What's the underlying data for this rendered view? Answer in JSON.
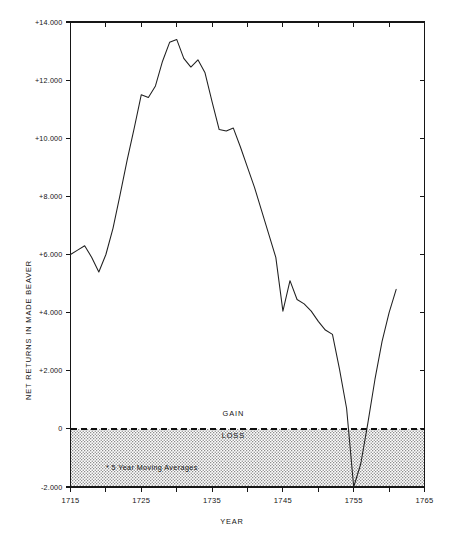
{
  "chart_data": {
    "type": "line",
    "title": "",
    "xlabel": "YEAR",
    "ylabel": "NET RETURNS IN MADE BEAVER",
    "xlim": [
      1715,
      1765
    ],
    "ylim": [
      -2000,
      14000
    ],
    "grid": false,
    "legend_position": "none",
    "x_tick_labels": [
      "1715",
      "1725",
      "1735",
      "1745",
      "1755",
      "1765"
    ],
    "x_tick_values": [
      1715,
      1725,
      1735,
      1745,
      1755,
      1765
    ],
    "x_minor_tick_values": [
      1720,
      1730,
      1740,
      1750,
      1760
    ],
    "y_tick_labels": [
      "+14.000",
      "+12.000",
      "+10.000",
      "+8.000",
      "+6.000",
      "+4.000",
      "+2.000",
      "0",
      "-2.000"
    ],
    "y_tick_values": [
      14000,
      12000,
      10000,
      8000,
      6000,
      4000,
      2000,
      0,
      -2000
    ],
    "annotations": [
      {
        "name": "gain-label",
        "text": "GAIN",
        "x": 1738,
        "y": 450
      },
      {
        "name": "loss-label",
        "text": "LOSS",
        "x": 1738,
        "y": -330
      },
      {
        "name": "moving-average-note",
        "text": "* 5 Year Moving Averages",
        "x": 1720,
        "y": -1420
      }
    ],
    "zero_reference_line": 0,
    "shaded_region": {
      "label": "LOSS",
      "from": 0,
      "to": -2000,
      "pattern": "stipple"
    },
    "series": [
      {
        "name": "Net returns in made beaver (5 year moving average)",
        "x": [
          1715,
          1716,
          1717,
          1718,
          1719,
          1720,
          1721,
          1722,
          1723,
          1724,
          1725,
          1726,
          1727,
          1728,
          1729,
          1730,
          1731,
          1732,
          1733,
          1734,
          1735,
          1736,
          1737,
          1738,
          1739,
          1740,
          1741,
          1742,
          1743,
          1744,
          1745,
          1746,
          1747,
          1748,
          1749,
          1750,
          1751,
          1752,
          1753,
          1754,
          1755,
          1756,
          1757,
          1758,
          1759,
          1760,
          1761
        ],
        "values": [
          6000,
          6150,
          6300,
          5900,
          5400,
          6000,
          6900,
          8050,
          9250,
          10350,
          11500,
          11400,
          11800,
          12650,
          13300,
          13400,
          12750,
          12450,
          12700,
          12250,
          11250,
          10300,
          10250,
          10350,
          9700,
          9000,
          8300,
          7500,
          6700,
          5900,
          4050,
          5100,
          4450,
          4300,
          4050,
          3700,
          3400,
          3250,
          2050,
          700,
          -2000,
          -1200,
          200,
          1700,
          3000,
          4000,
          4800
        ]
      }
    ]
  },
  "axes": {
    "y_title": "NET RETURNS IN MADE BEAVER",
    "x_title": "YEAR"
  }
}
